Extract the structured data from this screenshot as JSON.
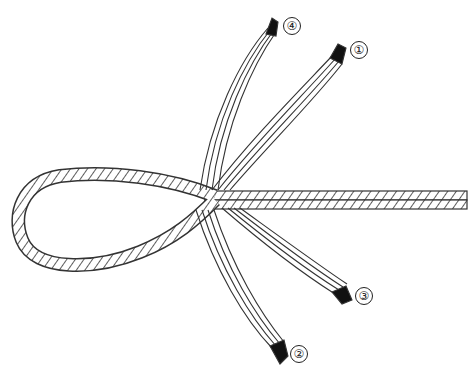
{
  "diagram": {
    "type": "rope-splice-eye",
    "colors": {
      "line": "#333333",
      "tip": "#111111",
      "background": "#ffffff"
    },
    "strands": [
      {
        "id": 1,
        "label": "①"
      },
      {
        "id": 2,
        "label": "②"
      },
      {
        "id": 3,
        "label": "③"
      },
      {
        "id": 4,
        "label": "④"
      }
    ]
  }
}
